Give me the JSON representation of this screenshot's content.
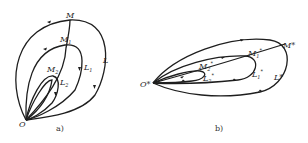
{
  "panels": [
    {
      "caption": "a)",
      "labels": {
        "M": "M",
        "M1": "M",
        "M1_sub": "1",
        "M2": "M",
        "M2_sub": "2",
        "L": "L",
        "L1": "L",
        "L1_sub": "1",
        "L2": "L",
        "L2_sub": "2",
        "O": "O"
      }
    },
    {
      "caption": "b)",
      "labels": {
        "M": "M*",
        "M1": "M",
        "M1_sub": "1",
        "M1_sup": "*",
        "M2": "M",
        "M2_sub": "2",
        "M2_sup": "*",
        "L": "L*",
        "L1": "L",
        "L1_sub": "1",
        "L1_sup": "*",
        "L2": "L",
        "L2_sub": "2",
        "L2_sup": "*",
        "O": "O*"
      }
    }
  ],
  "colors": {
    "stroke": "#1e1e1e",
    "background": "#ffffff"
  }
}
